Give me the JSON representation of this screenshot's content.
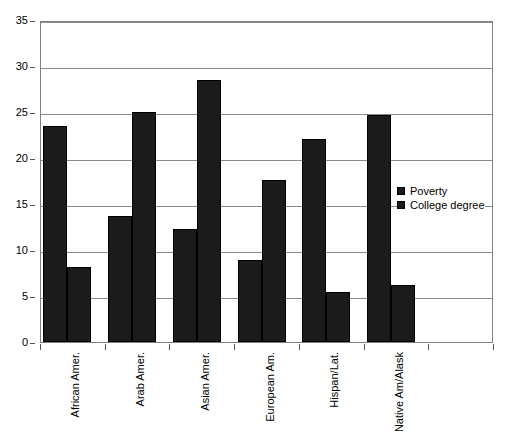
{
  "chart_data": {
    "type": "bar",
    "title": "",
    "xlabel": "",
    "ylabel": "",
    "ylim": [
      0,
      35
    ],
    "ytick_step": 5,
    "yticks": [
      "0",
      "5",
      "10",
      "15",
      "20",
      "25",
      "30",
      "35"
    ],
    "grid": true,
    "legend_position": "inside-right",
    "categories": [
      "African Amer.",
      "Arab Amer.",
      "Asian Amer.",
      "European Am.",
      "Hispan/Lat.",
      "Native Am/Alask",
      ""
    ],
    "series": [
      {
        "name": "Poverty",
        "color": "#1b1b1b",
        "values": [
          23.5,
          13.7,
          12.3,
          8.9,
          22.1,
          24.7,
          null
        ]
      },
      {
        "name": "College degree",
        "color": "#1b1b1b",
        "values": [
          8.2,
          25.0,
          28.5,
          17.6,
          5.4,
          6.2,
          null
        ]
      }
    ]
  },
  "legend": {
    "items": [
      {
        "label": "Poverty",
        "color": "#1b1b1b"
      },
      {
        "label": "College degree",
        "color": "#1b1b1b"
      }
    ]
  },
  "colors": {
    "bar_fill": "#1b1b1b",
    "bar_stroke": "#000000",
    "gridline": "#8c8c8c",
    "axis": "#808080",
    "background": "#ffffff",
    "text": "#000000"
  }
}
